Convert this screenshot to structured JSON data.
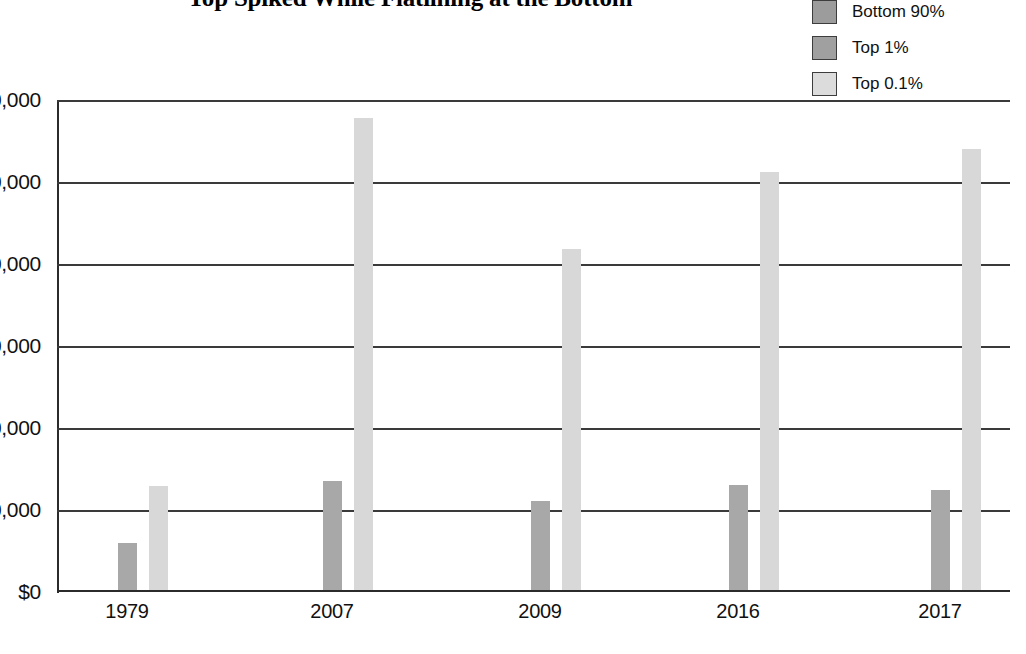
{
  "chart_data": {
    "type": "bar",
    "title": "Top Spiked While Flatlining at the Bottom",
    "xlabel": "",
    "ylabel": "",
    "categories": [
      "1979",
      "2007",
      "2009",
      "2016",
      "2017"
    ],
    "series": [
      {
        "name": "Bottom 90%",
        "color": "#9c9c9c",
        "values": [
          18000,
          20000,
          18000,
          22000,
          21000
        ]
      },
      {
        "name": "Top 1%",
        "color": "#a8a8a8",
        "values": [
          600000,
          1350000,
          1110000,
          1300000,
          1240000
        ]
      },
      {
        "name": "Top 0.1%",
        "color": "#d8d8d8",
        "values": [
          1290000,
          5780000,
          4180000,
          5120000,
          5400000
        ]
      }
    ],
    "ylim": [
      0,
      6000000
    ],
    "ytick_values": [
      0,
      1000000,
      2000000,
      3000000,
      4000000,
      5000000,
      6000000
    ],
    "ytick_labels": [
      "$0",
      "0,000",
      "0,000",
      "0,000",
      "0,000",
      "0,000",
      "0,000"
    ],
    "grid": true,
    "legend_position": "top-right"
  },
  "legend": {
    "items": [
      {
        "label": "Bottom 90%",
        "swatch": "legend-swatch-bottom90"
      },
      {
        "label": "Top 1%",
        "swatch": "legend-swatch-top1"
      },
      {
        "label": "Top 0.1%",
        "swatch": "legend-swatch-top01"
      }
    ]
  },
  "axes": {
    "y_labels": [
      "0,000",
      "0,000",
      "0,000",
      "0,000",
      "0,000",
      "0,000",
      "$0"
    ],
    "x_labels": [
      "1979",
      "2007",
      "2009",
      "2016",
      "2017"
    ]
  }
}
